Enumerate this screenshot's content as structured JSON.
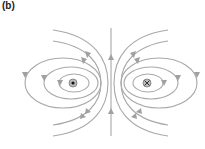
{
  "figure": {
    "panel_label": "(b)",
    "left_current": {
      "symbol": "dot",
      "meaning": "current out of page"
    },
    "right_current": {
      "symbol": "cross",
      "meaning": "current into page"
    },
    "line_color": "#a8a8a8",
    "marker_color": "#555555"
  }
}
